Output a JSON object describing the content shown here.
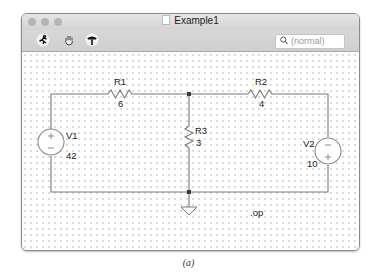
{
  "window": {
    "title": "Example1",
    "doc_icon": "document-icon"
  },
  "toolbar": {
    "tools": [
      {
        "name": "run-icon",
        "glyph": "🏃"
      },
      {
        "name": "halt-hand-icon",
        "glyph": "✋"
      },
      {
        "name": "probe-hammer-icon",
        "glyph": "🔨"
      }
    ],
    "search": {
      "icon": "search-icon",
      "placeholder": "(normal)"
    }
  },
  "schematic": {
    "components": [
      {
        "ref": "R1",
        "value": "6",
        "type": "resistor"
      },
      {
        "ref": "R2",
        "value": "4",
        "type": "resistor"
      },
      {
        "ref": "R3",
        "value": "3",
        "type": "resistor"
      },
      {
        "ref": "V1",
        "value": "42",
        "type": "voltage-source",
        "polarity": "plus-top"
      },
      {
        "ref": "V2",
        "value": "10",
        "type": "voltage-source",
        "polarity": "minus-top"
      }
    ],
    "directive": ".op",
    "ground": "ground-icon"
  },
  "caption": "(a)",
  "colors": {
    "wire": "#7a7a7a",
    "node": "#3a3a3a",
    "source": "#8a8a8a",
    "grid_dot": "#c7c7c7"
  }
}
